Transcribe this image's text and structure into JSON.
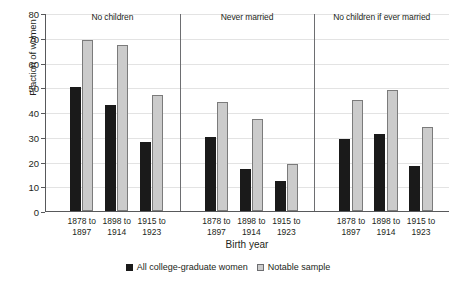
{
  "chart_data": {
    "type": "bar",
    "title": "",
    "xlabel": "Birth year",
    "ylabel": "Fraction of women",
    "ylim": [
      0,
      80
    ],
    "ytick_step": 10,
    "yticks": [
      0,
      10,
      20,
      30,
      40,
      50,
      60,
      70,
      80
    ],
    "grid": true,
    "legend_position": "bottom",
    "panels": [
      {
        "title": "No children",
        "categories": [
          "1878 to 1897",
          "1898 to 1914",
          "1915 to 1923"
        ],
        "series": [
          {
            "name": "All college-graduate women",
            "values": [
              50,
              43,
              28
            ]
          },
          {
            "name": "Notable sample",
            "values": [
              69,
              67,
              47
            ]
          }
        ]
      },
      {
        "title": "Never married",
        "categories": [
          "1878 to 1897",
          "1898 to 1914",
          "1915 to 1923"
        ],
        "series": [
          {
            "name": "All college-graduate women",
            "values": [
              30,
              17,
              12
            ]
          },
          {
            "name": "Notable sample",
            "values": [
              44,
              37,
              19
            ]
          }
        ]
      },
      {
        "title": "No children if ever married",
        "categories": [
          "1878 to 1897",
          "1898 to 1914",
          "1915 to 1923"
        ],
        "series": [
          {
            "name": "All college-graduate women",
            "values": [
              29,
              31,
              18
            ]
          },
          {
            "name": "Notable sample",
            "values": [
              45,
              49,
              34
            ]
          }
        ]
      }
    ],
    "category_label_lines": [
      [
        "1878 to",
        "1897"
      ],
      [
        "1898 to",
        "1914"
      ],
      [
        "1915 to",
        "1923"
      ]
    ],
    "legend": [
      {
        "label": "All college-graduate women",
        "swatch": "dark"
      },
      {
        "label": "Notable sample",
        "swatch": "light"
      }
    ],
    "colors": {
      "dark_bar": "#1a1a1a",
      "light_bar": "#cbcbcb",
      "light_bar_border": "#7b7b7b",
      "gridline": "#e3e3e3",
      "axis": "#58595b",
      "divider": "#6d6e71",
      "text": "#231f20",
      "background": "#ffffff"
    }
  }
}
